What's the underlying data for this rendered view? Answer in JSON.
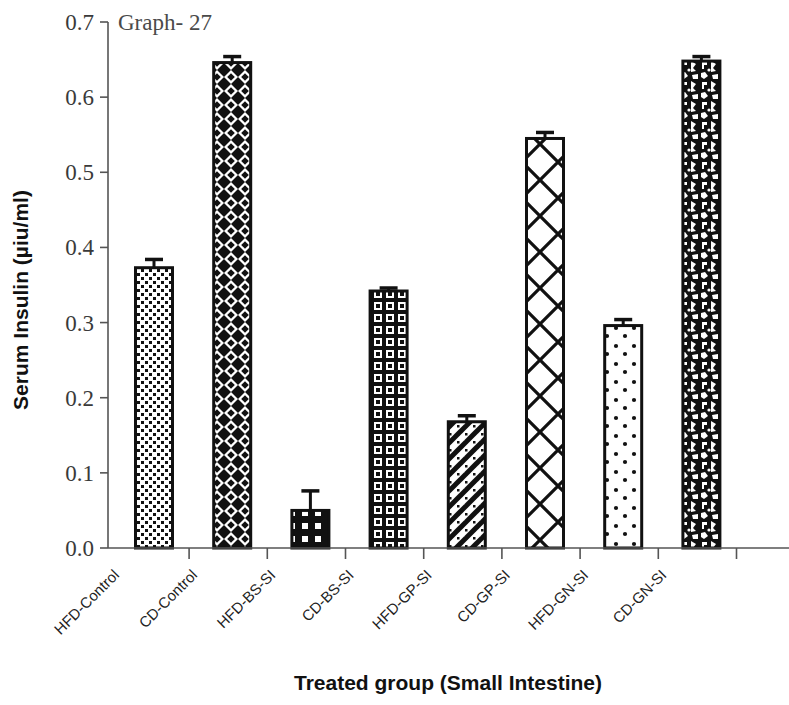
{
  "chart_data": {
    "type": "bar",
    "title": "Graph- 27",
    "xlabel": "Treated group (Small Intestine)",
    "ylabel": "Serum Insulin (µiu/ml)",
    "ylim": [
      0.0,
      0.7
    ],
    "ytick_labels": [
      "0.7",
      "0.6",
      "0.5",
      "0.4",
      "0.3",
      "0.2",
      "0.1",
      "0.0"
    ],
    "ytick_values": [
      0.7,
      0.6,
      0.5,
      0.4,
      0.3,
      0.2,
      0.1,
      0.0
    ],
    "grid": false,
    "legend": "none",
    "categories": [
      "HFD-Control",
      "CD-Control",
      "HFD-BS-SI",
      "CD-BS-SI",
      "HFD-GP-SI",
      "CD-GP-SI",
      "HFD-GN-SI",
      "CD-GN-SI"
    ],
    "values": [
      0.373,
      0.646,
      0.05,
      0.342,
      0.168,
      0.545,
      0.296,
      0.648
    ],
    "errors": [
      0.011,
      0.008,
      0.026,
      0.004,
      0.008,
      0.008,
      0.008,
      0.006
    ],
    "bar_patterns": [
      "light-dotted",
      "diamond-dense-dark",
      "dark-square-dots",
      "dark-grid",
      "diagonal-zigzag",
      "open-diagonal-lattice",
      "white-sparse-dots",
      "dark-mottled"
    ],
    "colors": {
      "ink": "#000000",
      "axis": "#555555",
      "tick_text": "#3a3a3a",
      "background": "#ffffff"
    }
  }
}
